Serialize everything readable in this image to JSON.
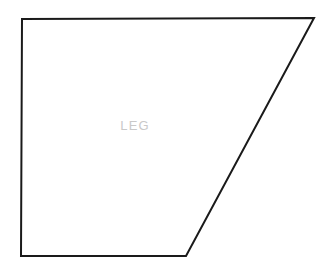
{
  "canvas": {
    "width": 334,
    "height": 274,
    "background_color": "#ffffff"
  },
  "shape": {
    "name": "LEG",
    "type": "quadrilateral",
    "description": "trapezoid outline",
    "stroke_color": "#1a1a1a",
    "stroke_width": 2,
    "fill_color": "#ffffff",
    "points": "22,19 314,18 186,256 21,256",
    "vertices": [
      {
        "label": "top-left",
        "x": 22,
        "y": 19
      },
      {
        "label": "top-right",
        "x": 314,
        "y": 18
      },
      {
        "label": "bottom-right",
        "x": 186,
        "y": 256
      },
      {
        "label": "bottom-left",
        "x": 21,
        "y": 256
      }
    ]
  },
  "label": {
    "text": "LEG",
    "color": "#c9c9c9",
    "font_size_px": 13,
    "center_x": 135,
    "center_y": 125
  }
}
